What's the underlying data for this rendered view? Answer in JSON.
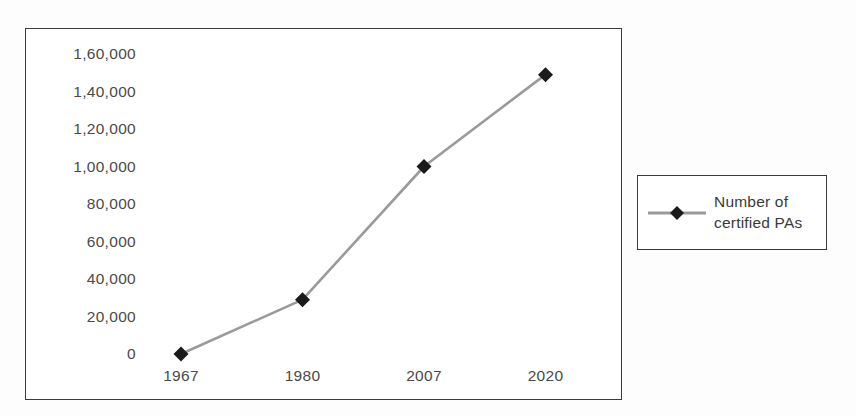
{
  "chart_data": {
    "type": "line",
    "title": "",
    "xlabel": "",
    "ylabel": "",
    "categories": [
      "1967",
      "1980",
      "2007",
      "2020"
    ],
    "series": [
      {
        "name": "Number of certified PAs",
        "values": [
          0,
          29000,
          100000,
          149000
        ]
      }
    ],
    "ylim": [
      0,
      160000
    ],
    "y_ticks": [
      "1,60,000",
      "1,40,000",
      "1,20,000",
      "1,00,000",
      "80,000",
      "60,000",
      "40,000",
      "20,000",
      "0"
    ],
    "y_tick_values": [
      160000,
      140000,
      120000,
      100000,
      80000,
      60000,
      40000,
      20000,
      0
    ],
    "x_ticks": [
      "1967",
      "1980",
      "2007",
      "2020"
    ],
    "grid": false,
    "legend_position": "right-outside",
    "marker": "diamond",
    "colors": {
      "line": "#9a9a9a",
      "marker": "#1a1a1a",
      "text": "#4a4a4a",
      "border": "#3b3b3b",
      "background": "#ffffff"
    }
  },
  "legend": {
    "label": "Number of certified PAs",
    "marker_name": "diamond-marker"
  }
}
